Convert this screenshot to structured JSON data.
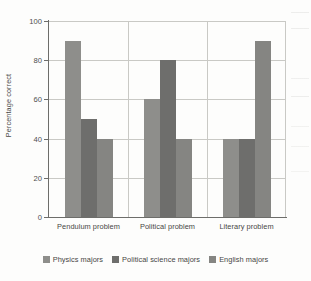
{
  "chart_data": {
    "type": "bar",
    "title": "",
    "xlabel": "",
    "ylabel": "Percentage correct",
    "ylim": [
      0,
      100
    ],
    "yticks": [
      0,
      20,
      40,
      60,
      80,
      100
    ],
    "grid": "horizontal",
    "legend_position": "bottom",
    "categories": [
      "Pendulum problem",
      "Political problem",
      "Literary problem"
    ],
    "series": [
      {
        "name": "Physics majors",
        "color": "#8e8e8b",
        "values": [
          90,
          60,
          40
        ]
      },
      {
        "name": "Political science majors",
        "color": "#6e6e6c",
        "values": [
          50,
          80,
          40
        ]
      },
      {
        "name": "English majors",
        "color": "#858582",
        "values": [
          40,
          40,
          90
        ]
      }
    ]
  },
  "axis": {
    "y_title": "Percentage correct",
    "tick_labels": [
      "100",
      "80",
      "60",
      "40",
      "20",
      "0"
    ]
  },
  "legend": {
    "items": [
      {
        "label": "Physics majors"
      },
      {
        "label": "Political science majors"
      },
      {
        "label": "English majors"
      }
    ]
  }
}
